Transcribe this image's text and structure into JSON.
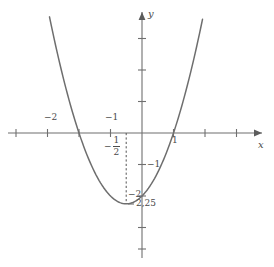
{
  "figure": {
    "width": 274,
    "height": 267,
    "background": "#ffffff",
    "curve_color": "#6e6e6e",
    "axis_color": "#6f6f6f",
    "text_color": "#4a4a4a",
    "guide_color": "#555555"
  },
  "axes": {
    "x_name": "x",
    "y_name": "y",
    "origin_px": {
      "x": 142,
      "y": 133
    },
    "unit_px": {
      "x": 31.5,
      "y": 31.5
    }
  },
  "labels": {
    "x_minus_2": "−2",
    "x_minus_1": "−1",
    "x_one": "1",
    "y_minus_1": "−1",
    "y_minus_2": "−2",
    "vertex_value": "2,25",
    "half_minus": "−",
    "half_num": "1",
    "half_den": "2"
  },
  "chart_data": {
    "type": "line",
    "title": "",
    "subtitle": "",
    "xlabel": "x",
    "ylabel": "y",
    "xlim": [
      -4.5,
      4.2
    ],
    "ylim": [
      -4.2,
      4.2
    ],
    "grid": false,
    "legend": "none",
    "function": "y = x^2 + x - 2",
    "equivalent_form": "y = (x + 0.5)^2 - 2.25",
    "vertex": {
      "x": -0.5,
      "y": -2.25,
      "label": "2,25"
    },
    "roots": [
      -2,
      1
    ],
    "y_intercept": -2,
    "x_ticks": [
      -4,
      -3,
      -2,
      -1,
      1,
      2,
      3
    ],
    "x_tick_labels": [
      "",
      "",
      "−2",
      "−1",
      "1",
      "",
      ""
    ],
    "y_ticks": [
      3,
      2,
      1,
      -1,
      -2,
      -3,
      -4
    ],
    "y_tick_labels": [
      "",
      "",
      "",
      "−1",
      "−2",
      "",
      ""
    ],
    "annotations": [
      {
        "text": "−1/2",
        "x": -0.5,
        "y": -0.45,
        "kind": "fraction-label"
      },
      {
        "text": "2,25",
        "x": -0.25,
        "y": -2.4,
        "kind": "vertex-value"
      }
    ],
    "guides": [
      {
        "kind": "vertical-dashed",
        "x": -0.5,
        "y_from": 0,
        "y_to": -2.25
      }
    ],
    "series": [
      {
        "name": "y = x^2 + x - 2",
        "x": [
          -2.9,
          -2.6,
          -2.3,
          -2.0,
          -1.7,
          -1.4,
          -1.1,
          -0.8,
          -0.5,
          -0.2,
          0.1,
          0.4,
          0.7,
          1.0,
          1.3,
          1.6,
          1.9
        ],
        "values": [
          4.51,
          2.16,
          0.99,
          0.0,
          -0.81,
          -1.44,
          -1.89,
          -2.16,
          -2.25,
          -2.16,
          -1.89,
          -1.44,
          -0.81,
          0.0,
          0.99,
          2.16,
          3.51
        ]
      }
    ]
  }
}
